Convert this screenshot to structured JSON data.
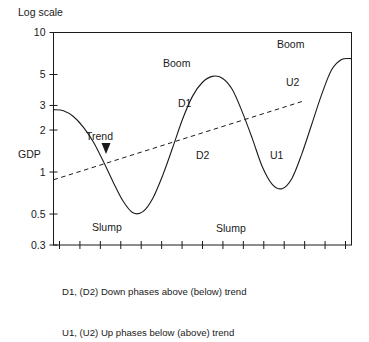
{
  "figure": {
    "top_label": "Log scale",
    "y_axis_title": "GDP",
    "caption_lines": [
      "D1, (D2) Down phases above (below) trend",
      "U1, (U2) Up phases below (above) trend"
    ]
  },
  "chart_data": {
    "type": "line",
    "title": "",
    "subtitle": "",
    "xlabel": "",
    "ylabel": "GDP",
    "y_scale": "log",
    "ylim": [
      0.3,
      10
    ],
    "y_tick_labels": [
      "10",
      "5",
      "3",
      "2",
      "1",
      "0.5",
      "0.3"
    ],
    "y_tick_values": [
      10,
      5,
      3,
      2,
      1,
      0.5,
      0.3
    ],
    "x_tick_count": 15,
    "x_tick_labels": [],
    "grid": false,
    "legend": "none",
    "series": [
      {
        "name": "GDP cycle",
        "style": "solid",
        "color": "#1a1a1a",
        "x": [
          0,
          4,
          8,
          12,
          16,
          20,
          24,
          28,
          32,
          36,
          40,
          44,
          48,
          52,
          56,
          60,
          64,
          68,
          72,
          76,
          80,
          84,
          88,
          92,
          96,
          100
        ],
        "y": [
          2.8,
          2.75,
          2.5,
          2.1,
          1.65,
          1.2,
          0.85,
          0.62,
          0.51,
          0.52,
          0.65,
          0.95,
          1.5,
          2.4,
          3.5,
          4.4,
          4.85,
          4.7,
          3.9,
          2.7,
          1.75,
          1.1,
          0.82,
          0.76,
          0.9,
          1.35
        ]
      },
      {
        "name": "GDP cycle (continued)",
        "style": "solid",
        "color": "#1a1a1a",
        "x": [
          100,
          104,
          108,
          112,
          116,
          120
        ],
        "y": [
          1.35,
          2.2,
          3.6,
          5.4,
          6.4,
          6.5
        ]
      },
      {
        "name": "Trend",
        "style": "dashed",
        "color": "#1a1a1a",
        "x": [
          0,
          100
        ],
        "y": [
          0.88,
          3.2
        ]
      }
    ],
    "annotations": [
      {
        "label": "Trend",
        "kind": "callout",
        "points_to": "trend-line"
      },
      {
        "label": "Boom",
        "kind": "peak",
        "occurrence": 1
      },
      {
        "label": "Boom",
        "kind": "peak",
        "occurrence": 2
      },
      {
        "label": "Slump",
        "kind": "trough",
        "occurrence": 1
      },
      {
        "label": "Slump",
        "kind": "trough",
        "occurrence": 2
      },
      {
        "label": "D1",
        "kind": "phase"
      },
      {
        "label": "D2",
        "kind": "phase"
      },
      {
        "label": "U1",
        "kind": "phase"
      },
      {
        "label": "U2",
        "kind": "phase"
      }
    ]
  }
}
